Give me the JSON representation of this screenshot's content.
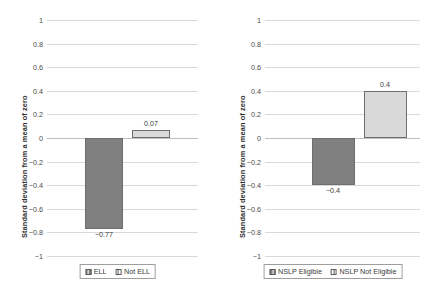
{
  "chart_data": [
    {
      "panel": "left",
      "type": "bar",
      "title": "",
      "xlabel": "",
      "ylabel": "Standard deviation from a mean of zero",
      "categories": [
        "ELL",
        "Not ELL"
      ],
      "values": [
        -0.77,
        0.07
      ],
      "value_labels": [
        "−0.77",
        "0.07"
      ],
      "ylim": [
        -1,
        1
      ],
      "yticks": [
        1,
        0.8,
        0.6,
        0.4,
        0.2,
        0,
        -0.2,
        -0.4,
        -0.6,
        -0.8,
        -1
      ],
      "ytick_labels": [
        "1",
        "0.8",
        "0.6",
        "0.4",
        "0.2",
        "0",
        "−0.2",
        "−0.4",
        "−0.6",
        "−0.8",
        "−1"
      ],
      "grid": true,
      "legend_position": "bottom",
      "legend": [
        {
          "label": "ELL",
          "color": "#808080",
          "swatch": "dark"
        },
        {
          "label": "Not ELL",
          "color": "#d9d9d9",
          "swatch": "light"
        }
      ]
    },
    {
      "panel": "right",
      "type": "bar",
      "title": "",
      "xlabel": "",
      "ylabel": "Standard deviation from a mean of zero",
      "categories": [
        "NSLP Eligible",
        "NSLP Not Eligible"
      ],
      "values": [
        -0.4,
        0.4
      ],
      "value_labels": [
        "−0.4",
        "0.4"
      ],
      "ylim": [
        -1,
        1
      ],
      "yticks": [
        1,
        0.8,
        0.6,
        0.4,
        0.2,
        0,
        -0.2,
        -0.4,
        -0.6,
        -0.8,
        -1
      ],
      "ytick_labels": [
        "1",
        "0.8",
        "0.6",
        "0.4",
        "0.2",
        "0",
        "−0.2",
        "−0.4",
        "−0.6",
        "−0.8",
        "−1"
      ],
      "grid": true,
      "legend_position": "bottom",
      "legend": [
        {
          "label": "NSLP Eligible",
          "color": "#808080",
          "swatch": "dark"
        },
        {
          "label": "NSLP Not Eligible",
          "color": "#d9d9d9",
          "swatch": "light"
        }
      ]
    }
  ],
  "colors": {
    "dark_bar": "#808080",
    "light_bar": "#d9d9d9",
    "gridline": "#d9d9d9",
    "zero_line": "#bfbfbf",
    "text": "#3a3a3a",
    "legend_border": "#9e9e9e"
  }
}
